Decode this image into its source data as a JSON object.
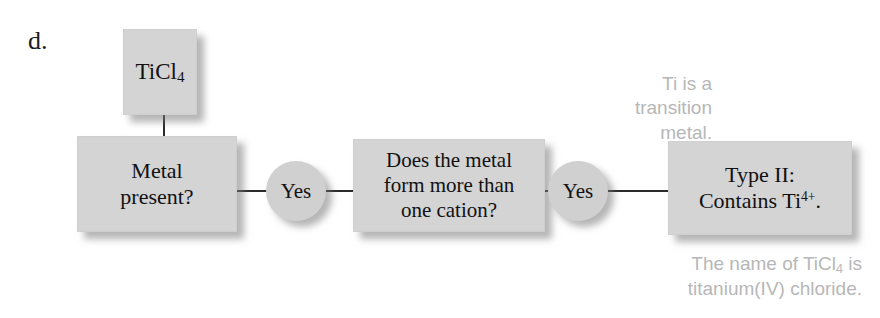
{
  "figure": {
    "part_label": "d.",
    "type": "flowchart"
  },
  "nodes": {
    "formula": {
      "label": "TiCl4",
      "text_main": "TiCl",
      "text_sub": "4"
    },
    "decision_metal": {
      "line1": "Metal",
      "line2": "present?"
    },
    "decision_cation": {
      "line1": "Does the metal",
      "line2": "form more than",
      "line3": "one cation?"
    },
    "result_type": {
      "line1": "Type II:",
      "line2_pre": "Contains Ti",
      "line2_sup": "4+",
      "line2_post": "."
    }
  },
  "connectors": {
    "yes_first": "Yes",
    "yes_second": "Yes"
  },
  "annotations": {
    "top": {
      "line1": "Ti is a",
      "line2": "transition",
      "line3": "metal."
    },
    "bottom": {
      "line1_pre": "The name of TiCl",
      "line1_sub": "4",
      "line1_post": " is",
      "line2": "titanium(IV) chloride."
    }
  },
  "colors": {
    "node_fill": "#d4d4d4",
    "ellipse_fill": "#d0d0d0",
    "text": "#111111",
    "annotation": "#b7b7b7",
    "connector": "#2b2b2b",
    "background": "#ffffff"
  }
}
